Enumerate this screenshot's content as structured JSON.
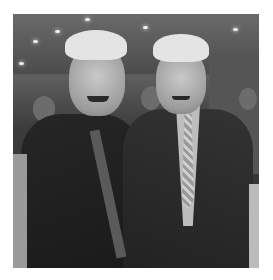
{
  "image": {
    "description": "Grayscale photograph of two smiling white-haired men in dark suits standing side by side in a room with ceiling lights",
    "colors": {
      "background": "#ffffff",
      "suit": "#222222",
      "hair": "#e4e4e4"
    }
  }
}
